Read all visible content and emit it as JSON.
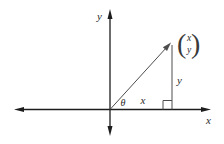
{
  "diagram": {
    "background_color": "#ffffff",
    "axis_color": "#1d1d1d",
    "line_color": "#4d4d4d",
    "labels": {
      "y_axis": "y",
      "x_axis": "x",
      "angle": "θ",
      "x_component": "x",
      "y_component": "y"
    },
    "column_vector": {
      "left_paren": "(",
      "right_paren": ")",
      "top_entry": "x",
      "bottom_entry": "y"
    }
  }
}
